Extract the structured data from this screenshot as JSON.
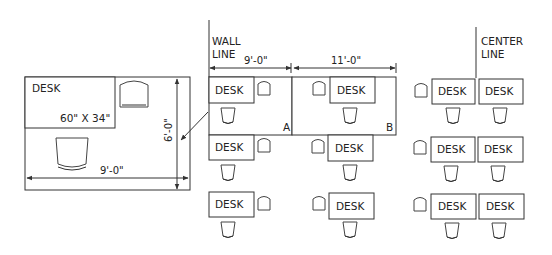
{
  "detail": {
    "desk_label": "DESK",
    "desk_size": "60\" X 34\"",
    "width_dim": "9'-0\"",
    "height_dim": "6'-0\""
  },
  "layout": {
    "wall_line": "WALL LINE",
    "wall_line_1": "WALL",
    "wall_line_2": "LINE",
    "center_line_1": "CENTER",
    "center_line_2": "LINE",
    "dim_a": "9'-0\"",
    "dim_b": "11'-0\"",
    "office_a": "A",
    "office_b": "B",
    "desk_label": "DESK"
  },
  "colors": {
    "line": "#333333",
    "background": "#ffffff"
  }
}
